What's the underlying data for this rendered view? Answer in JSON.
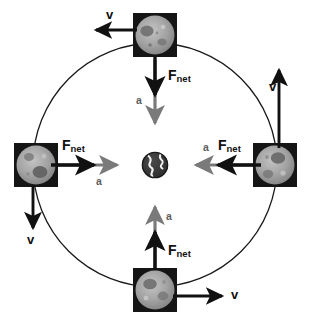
{
  "figure": {
    "type": "physics-vector-diagram",
    "background_color": "#ffffff",
    "orbit": {
      "name": "orbit-path",
      "shape": "circle",
      "center": {
        "x": 155,
        "y": 165
      },
      "radius": 122,
      "stroke_color": "#1a1a1a",
      "stroke_width": 1.3,
      "fill": "none"
    },
    "center_body": {
      "name": "earth",
      "label": "Earth",
      "x": 155,
      "y": 165,
      "radius": 13,
      "ocean_color": "#3a3a3a",
      "land_color": "#f2f2f2"
    },
    "vector_colors": {
      "force": "#111111",
      "acceleration": "#7a7a7a",
      "velocity": "#111111"
    },
    "moons": [
      {
        "name": "moon-top",
        "position": "top",
        "x": 155,
        "y": 35,
        "size": 44,
        "box_color": "#151515",
        "disc_color": "#9d9d9d",
        "velocity": {
          "label": "v",
          "direction": "left"
        },
        "force": {
          "label_main": "F",
          "label_sub": "net",
          "direction": "down"
        },
        "acceleration": {
          "label": "a",
          "direction": "down"
        }
      },
      {
        "name": "moon-right",
        "position": "right",
        "x": 275,
        "y": 165,
        "size": 44,
        "box_color": "#151515",
        "disc_color": "#9d9d9d",
        "velocity": {
          "label": "v",
          "direction": "up"
        },
        "force": {
          "label_main": "F",
          "label_sub": "net",
          "direction": "left"
        },
        "acceleration": {
          "label": "a",
          "direction": "left"
        }
      },
      {
        "name": "moon-bottom",
        "position": "bottom",
        "x": 155,
        "y": 290,
        "size": 44,
        "box_color": "#151515",
        "disc_color": "#9d9d9d",
        "velocity": {
          "label": "v",
          "direction": "right"
        },
        "force": {
          "label_main": "F",
          "label_sub": "net",
          "direction": "up"
        },
        "acceleration": {
          "label": "a",
          "direction": "up"
        }
      },
      {
        "name": "moon-left",
        "position": "left",
        "x": 36,
        "y": 165,
        "size": 44,
        "box_color": "#151515",
        "disc_color": "#9d9d9d",
        "velocity": {
          "label": "v",
          "direction": "down"
        },
        "force": {
          "label_main": "F",
          "label_sub": "net",
          "direction": "right"
        },
        "acceleration": {
          "label": "a",
          "direction": "right"
        }
      }
    ],
    "labels": {
      "top_v": "v",
      "top_f_main": "F",
      "top_f_sub": "net",
      "top_a": "a",
      "right_v": "v",
      "right_f_main": "F",
      "right_f_sub": "net",
      "right_a": "a",
      "bottom_v": "v",
      "bottom_f_main": "F",
      "bottom_f_sub": "net",
      "bottom_a": "a",
      "left_v": "v",
      "left_f_main": "F",
      "left_f_sub": "net",
      "left_a": "a"
    }
  }
}
